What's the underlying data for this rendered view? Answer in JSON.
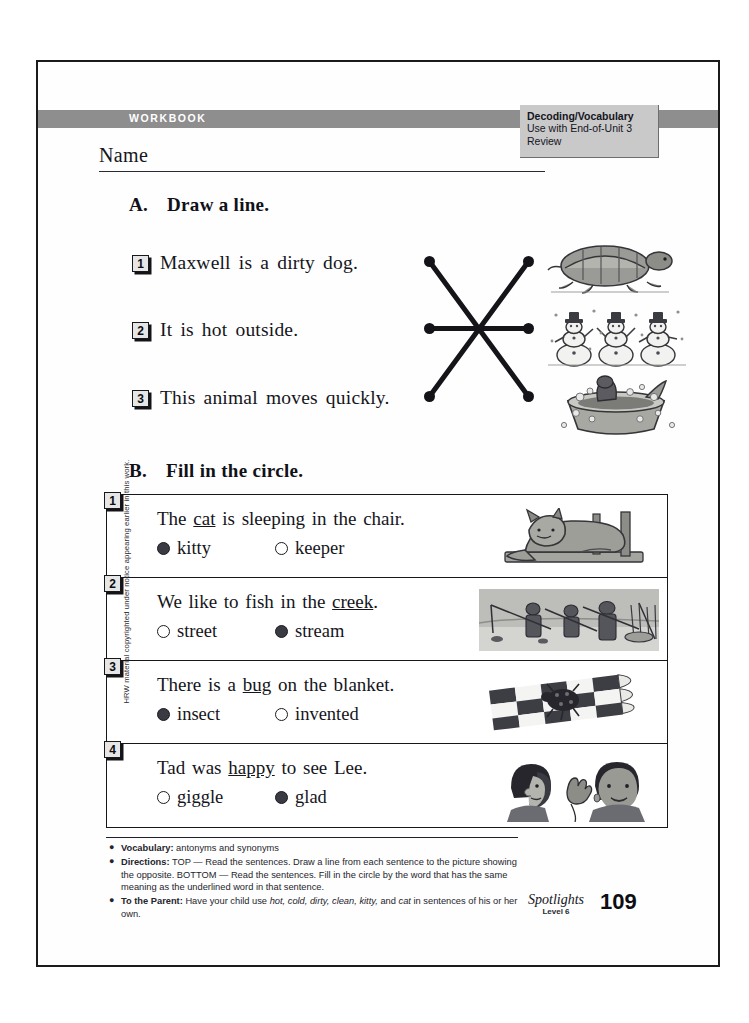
{
  "header": {
    "workbook_label": "WORKBOOK",
    "decoding_title": "Decoding/Vocabulary",
    "decoding_line1": "Use with End-of-Unit 3",
    "decoding_line2": "Review",
    "name_label": "Name"
  },
  "section_a": {
    "letter": "A.",
    "title": "Draw a line.",
    "items": [
      {
        "number": "1",
        "text": "Maxwell is a  dirty  dog."
      },
      {
        "number": "2",
        "text": "It is  hot  outside."
      },
      {
        "number": "3",
        "text": "This animal  moves  quickly."
      }
    ],
    "pictures": [
      {
        "name": "turtle-picture",
        "alt": "turtle"
      },
      {
        "name": "snowmen-picture",
        "alt": "snowmen"
      },
      {
        "name": "dog-bath-picture",
        "alt": "dog in bathtub"
      }
    ]
  },
  "section_b": {
    "letter": "B.",
    "title": "Fill in the circle.",
    "items": [
      {
        "number": "1",
        "before": "The ",
        "underlined": "cat",
        "after": " is sleeping in the chair.",
        "choices": [
          {
            "label": "kitty",
            "selected": true
          },
          {
            "label": "keeper",
            "selected": false
          }
        ],
        "picture": "sleeping-cat-picture"
      },
      {
        "number": "2",
        "before": "We like to fish in the ",
        "underlined": "creek",
        "after": ".",
        "choices": [
          {
            "label": "street",
            "selected": false
          },
          {
            "label": "stream",
            "selected": true
          }
        ],
        "picture": "children-fishing-picture"
      },
      {
        "number": "3",
        "before": "There is a ",
        "underlined": "bug",
        "after": " on the blanket.",
        "choices": [
          {
            "label": "insect",
            "selected": true
          },
          {
            "label": "invented",
            "selected": false
          }
        ],
        "picture": "bug-on-blanket-picture"
      },
      {
        "number": "4",
        "before": "Tad was ",
        "underlined": "happy",
        "after": " to see Lee.",
        "choices": [
          {
            "label": "giggle",
            "selected": false
          },
          {
            "label": "glad",
            "selected": true
          }
        ],
        "picture": "two-children-picture"
      }
    ]
  },
  "footer": {
    "vocabulary_label": "Vocabulary:",
    "vocabulary_text": " antonyms and synonyms",
    "directions_label": "Directions:",
    "directions_text": " TOP — Read the sentences. Draw a line from each sentence to the picture showing the opposite. BOTTOM — Read the sentences. Fill in the circle by the word that has the same meaning as the underlined word in that sentence.",
    "parent_label": "To the Parent:",
    "parent_text_pre": " Have your child use ",
    "parent_words": "hot, cold, dirty, clean, kitty,",
    "parent_text_mid": " and ",
    "parent_word_last": "cat",
    "parent_text_post": " in sentences of his or her own.",
    "series_name": "Spotlights",
    "series_level": "Level 6",
    "page_number": "109",
    "copyright": "HRW material copyrighted under notice appearing earlier in this work."
  },
  "colors": {
    "band_gray": "#8e8e8e",
    "box_gray": "#c9c9c9",
    "ink": "#15151b"
  }
}
